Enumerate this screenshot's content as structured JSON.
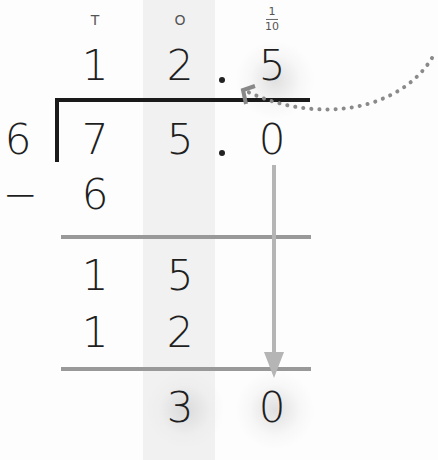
{
  "headers": {
    "tens": "T",
    "ones": "O",
    "tenths_num": "1",
    "tenths_den": "10"
  },
  "quotient": {
    "tens": "1",
    "ones": "2",
    "point": ".",
    "tenths": "5"
  },
  "divisor": "6",
  "dividend": {
    "tens": "7",
    "ones": "5",
    "point": ".",
    "tenths": "0"
  },
  "steps": [
    {
      "sign": "−",
      "tens": "6",
      "ones": ""
    },
    {
      "sign": "",
      "tens": "1",
      "ones": "5"
    },
    {
      "sign": "",
      "tens": "1",
      "ones": "2"
    },
    {
      "sign": "",
      "tens": "",
      "ones": "3",
      "tenths": "0"
    }
  ],
  "colors": {
    "ink": "#1f1f1f",
    "rule_gray": "#999999",
    "arrow_gray": "#b5b5b5",
    "dotted": "#8a8a8a",
    "stripe": "#f1f1f1"
  }
}
